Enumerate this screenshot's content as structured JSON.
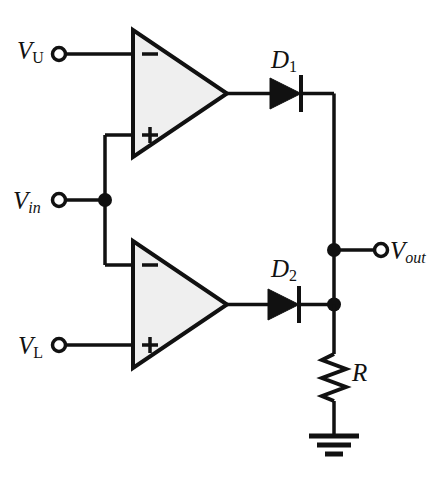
{
  "diagram": {
    "labels": {
      "v_upper_base": "V",
      "v_upper_sub": "U",
      "v_in_base": "V",
      "v_in_sub": "in",
      "v_lower_base": "V",
      "v_lower_sub": "L",
      "v_out_base": "V",
      "v_out_sub": "out",
      "diode1_base": "D",
      "diode1_sub": "1",
      "diode2_base": "D",
      "diode2_sub": "2",
      "resistor": "R"
    },
    "opamp_top": {
      "minus_sign": "−",
      "plus_sign": "+"
    },
    "opamp_bottom": {
      "minus_sign": "−",
      "plus_sign": "+"
    },
    "colors": {
      "line": "#111111",
      "opamp_fill": "#efefef",
      "background": "#ffffff",
      "terminal_fill": "#ffffff"
    }
  }
}
